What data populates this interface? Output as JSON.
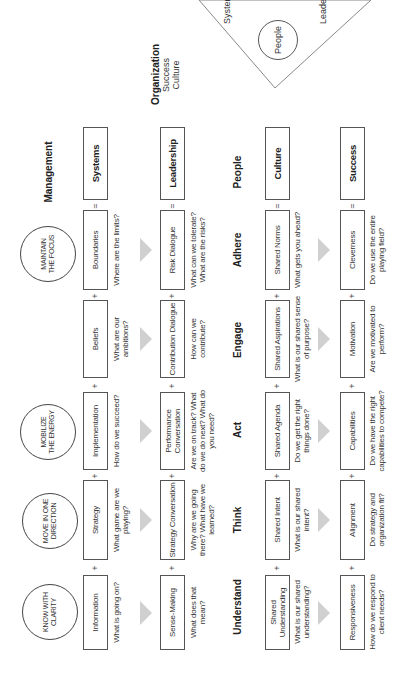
{
  "header_circles": [
    {
      "label": "Know with clarity"
    },
    {
      "label": "Move in one direction"
    },
    {
      "label": "Mobilize the energy"
    },
    {
      "label": "Maintain the focus"
    }
  ],
  "column_labels": {
    "management": "Management",
    "people": "People"
  },
  "rows": [
    {
      "cells": [
        {
          "label": "Information",
          "question": "What is going on?"
        },
        {
          "label": "Strategy",
          "question": "What game are we playing?"
        },
        {
          "label": "Implementation",
          "question": "How do we succeed?"
        },
        {
          "label": "Beliefs",
          "question": "What are our ambitions?"
        },
        {
          "label": "Boundaries",
          "question": "Where are the limits?"
        }
      ],
      "result": "Systems"
    },
    {
      "cells": [
        {
          "label": "Sense-Making",
          "question": "What does that mean?"
        },
        {
          "label": "Strategy Conversation",
          "question": "Why are we going there? What have we learned?"
        },
        {
          "label": "Performance Conversation",
          "question": "Are we on track? What do we do next? What do you need?"
        },
        {
          "label": "Contribution Dialogue",
          "question": "How can we contribute?"
        },
        {
          "label": "Risk Dialogue",
          "question": "What can we tolerate? What are the risks?"
        }
      ],
      "result": "Leadership"
    },
    {
      "cells": [
        {
          "label": "Shared Understanding",
          "question": "What is our shared understanding?"
        },
        {
          "label": "Shared Intent",
          "question": "What is our shared intent?"
        },
        {
          "label": "Shared Agenda",
          "question": "Do we get the right things done?"
        },
        {
          "label": "Shared Aspirations",
          "question": "What is our shared sense of purpose?"
        },
        {
          "label": "Shared Norms",
          "question": "What gets you ahead?"
        }
      ],
      "result": "Culture"
    },
    {
      "cells": [
        {
          "label": "Responsiveness",
          "question": "How do we respond to client needs?"
        },
        {
          "label": "Alignment",
          "question": "Do strategy and organization fit?"
        },
        {
          "label": "Capabilities",
          "question": "Do we have the right capabilities to compete?"
        },
        {
          "label": "Motivation",
          "question": "Are we motivated to perform?"
        },
        {
          "label": "Cleverness",
          "question": "Do we use the entire playing field?"
        }
      ],
      "result": "Success"
    }
  ],
  "verbs": [
    "Understand",
    "Think",
    "Act",
    "Engage",
    "Adhere"
  ],
  "operators": {
    "plus": "+",
    "equals": "="
  },
  "organization": {
    "title": "Organization",
    "lines": [
      "Success",
      "Culture"
    ],
    "triangle": {
      "center": "People",
      "left": "Leadership",
      "right": "Systems"
    }
  }
}
